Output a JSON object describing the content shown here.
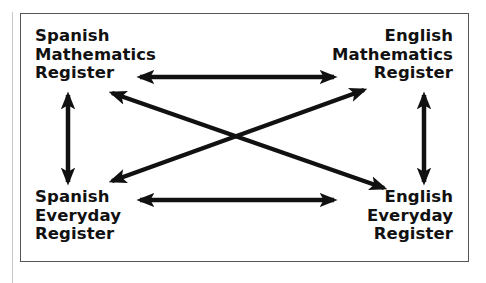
{
  "diagram": {
    "type": "register-relationship-diagram",
    "nodes": [
      {
        "id": "spanish-math",
        "lines": [
          "Spanish",
          "Mathematics",
          "Register"
        ],
        "position": "top-left"
      },
      {
        "id": "english-math",
        "lines": [
          "English",
          "Mathematics",
          "Register"
        ],
        "position": "top-right"
      },
      {
        "id": "spanish-everyday",
        "lines": [
          "Spanish",
          "Everyday",
          "Register"
        ],
        "position": "bottom-left"
      },
      {
        "id": "english-everyday",
        "lines": [
          "English",
          "Everyday",
          "Register"
        ],
        "position": "bottom-right"
      }
    ],
    "edges": [
      {
        "from": "spanish-math",
        "to": "english-math",
        "direction": "bidirectional"
      },
      {
        "from": "spanish-everyday",
        "to": "english-everyday",
        "direction": "bidirectional"
      },
      {
        "from": "spanish-math",
        "to": "spanish-everyday",
        "direction": "bidirectional"
      },
      {
        "from": "english-math",
        "to": "english-everyday",
        "direction": "bidirectional"
      },
      {
        "from": "spanish-math",
        "to": "english-everyday",
        "direction": "bidirectional"
      },
      {
        "from": "spanish-everyday",
        "to": "english-math",
        "direction": "bidirectional"
      }
    ],
    "colors": {
      "arrow": "#111111",
      "text": "#111111",
      "border": "#555555",
      "background": "#ffffff"
    }
  }
}
